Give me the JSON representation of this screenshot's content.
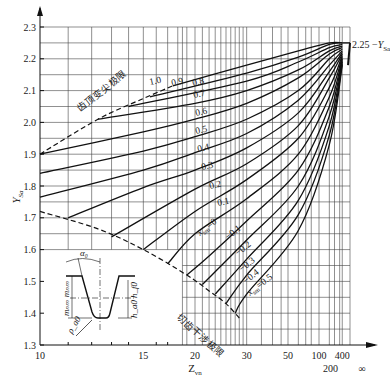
{
  "chart_data": {
    "type": "line",
    "title": "",
    "xlabel": "Z_vn",
    "ylabel": "Y_Sa",
    "xscale": "reciprocal (1 - 10/z), 10 to infinity",
    "ylim": [
      1.3,
      2.3
    ],
    "yticks": [
      1.3,
      1.4,
      1.5,
      1.6,
      1.7,
      1.8,
      1.9,
      2.0,
      2.1,
      2.2,
      2.3
    ],
    "xticks": [
      {
        "value": 10,
        "label": "10"
      },
      {
        "value": 15,
        "label": "15"
      },
      {
        "value": 20,
        "label": "20"
      },
      {
        "value": 30,
        "label": "30"
      },
      {
        "value": 50,
        "label": "50"
      },
      {
        "value": 100,
        "label": "100"
      },
      {
        "value": 200,
        "label": "200"
      },
      {
        "value": 400,
        "label": "400"
      },
      {
        "value": "inf",
        "label": "∞"
      }
    ],
    "grid": true,
    "right_annotation": "2.25 − Y_Sa",
    "limit_curves": [
      {
        "name": "齿顶变尖极限",
        "meaning": "tooth tip pointing limit",
        "style": "dashed",
        "points": [
          [
            10,
            1.9
          ],
          [
            12.3,
            2.01
          ],
          [
            15,
            2.075
          ],
          [
            17.5,
            2.115
          ]
        ]
      },
      {
        "name": "切齿干涉极限",
        "meaning": "cutting interference limit",
        "style": "dashed",
        "points": [
          [
            10,
            1.72
          ],
          [
            12.3,
            1.665
          ],
          [
            15,
            1.6
          ],
          [
            19,
            1.52
          ],
          [
            22,
            1.47
          ],
          [
            25,
            1.43
          ],
          [
            28,
            1.385
          ]
        ]
      }
    ],
    "series_label_prefix": "x_sm",
    "series": [
      {
        "name": "1.0",
        "points": [
          [
            17.5,
            2.115
          ],
          [
            30,
            2.18
          ],
          [
            60,
            2.225
          ],
          [
            150,
            2.25
          ],
          [
            400,
            2.25
          ]
        ]
      },
      {
        "name": "0.9",
        "points": [
          [
            15.5,
            2.08
          ],
          [
            30,
            2.155
          ],
          [
            60,
            2.205
          ],
          [
            150,
            2.245
          ],
          [
            400,
            2.25
          ]
        ]
      },
      {
        "name": "0.8",
        "points": [
          [
            14,
            2.05
          ],
          [
            30,
            2.13
          ],
          [
            60,
            2.19
          ],
          [
            150,
            2.235
          ],
          [
            400,
            2.245
          ]
        ]
      },
      {
        "name": "0.7",
        "points": [
          [
            12.3,
            2.01
          ],
          [
            20,
            2.06
          ],
          [
            30,
            2.1
          ],
          [
            60,
            2.165
          ],
          [
            150,
            2.225
          ],
          [
            400,
            2.24
          ]
        ]
      },
      {
        "name": "0.6",
        "points": [
          [
            10,
            1.9
          ],
          [
            15,
            1.97
          ],
          [
            20,
            2.01
          ],
          [
            30,
            2.06
          ],
          [
            60,
            2.14
          ],
          [
            150,
            2.215
          ],
          [
            400,
            2.235
          ]
        ]
      },
      {
        "name": "0.5",
        "points": [
          [
            10,
            1.84
          ],
          [
            15,
            1.91
          ],
          [
            20,
            1.955
          ],
          [
            30,
            2.01
          ],
          [
            60,
            2.1
          ],
          [
            150,
            2.2
          ],
          [
            400,
            2.23
          ]
        ]
      },
      {
        "name": "0.4",
        "points": [
          [
            10,
            1.765
          ],
          [
            15,
            1.85
          ],
          [
            20,
            1.905
          ],
          [
            30,
            1.965
          ],
          [
            60,
            2.07
          ],
          [
            150,
            2.18
          ],
          [
            400,
            2.225
          ]
        ]
      },
      {
        "name": "0.3",
        "points": [
          [
            11,
            1.7
          ],
          [
            15,
            1.795
          ],
          [
            20,
            1.85
          ],
          [
            30,
            1.92
          ],
          [
            60,
            2.03
          ],
          [
            150,
            2.16
          ],
          [
            400,
            2.22
          ]
        ]
      },
      {
        "name": "0.2",
        "points": [
          [
            13,
            1.64
          ],
          [
            20,
            1.79
          ],
          [
            30,
            1.87
          ],
          [
            60,
            1.99
          ],
          [
            150,
            2.14
          ],
          [
            400,
            2.215
          ]
        ]
      },
      {
        "name": "0.1",
        "points": [
          [
            15,
            1.6
          ],
          [
            20,
            1.72
          ],
          [
            30,
            1.82
          ],
          [
            60,
            1.95
          ],
          [
            150,
            2.11
          ],
          [
            400,
            2.21
          ]
        ]
      },
      {
        "name": "0",
        "points": [
          [
            17,
            1.555
          ],
          [
            20,
            1.65
          ],
          [
            30,
            1.76
          ],
          [
            60,
            1.9
          ],
          [
            150,
            2.08
          ],
          [
            400,
            2.205
          ]
        ]
      },
      {
        "name": "-0.1",
        "points": [
          [
            19,
            1.52
          ],
          [
            22,
            1.58
          ],
          [
            30,
            1.69
          ],
          [
            60,
            1.85
          ],
          [
            150,
            2.05
          ],
          [
            400,
            2.2
          ]
        ]
      },
      {
        "name": "-0.2",
        "points": [
          [
            21,
            1.49
          ],
          [
            30,
            1.63
          ],
          [
            60,
            1.8
          ],
          [
            150,
            2.02
          ],
          [
            400,
            2.195
          ]
        ]
      },
      {
        "name": "-0.3",
        "points": [
          [
            23,
            1.46
          ],
          [
            30,
            1.57
          ],
          [
            60,
            1.755
          ],
          [
            150,
            1.99
          ],
          [
            400,
            2.19
          ]
        ]
      },
      {
        "name": "-0.4",
        "points": [
          [
            25,
            1.43
          ],
          [
            30,
            1.52
          ],
          [
            60,
            1.71
          ],
          [
            150,
            1.96
          ],
          [
            400,
            2.185
          ]
        ]
      },
      {
        "name": "-0.5",
        "points": [
          [
            27,
            1.4
          ],
          [
            30,
            1.46
          ],
          [
            60,
            1.66
          ],
          [
            150,
            1.93
          ],
          [
            400,
            2.18
          ]
        ]
      }
    ],
    "curve_labels": [
      {
        "text": "1.0",
        "x": 150,
        "y": 85
      },
      {
        "text": "0.9",
        "x": 172,
        "y": 86
      },
      {
        "text": "0.8",
        "x": 193,
        "y": 86
      },
      {
        "text": "0.7",
        "x": 194,
        "y": 98
      },
      {
        "text": "0.6",
        "x": 196,
        "y": 116
      },
      {
        "text": "0.5",
        "x": 196,
        "y": 134
      },
      {
        "text": "0.4",
        "x": 198,
        "y": 152
      },
      {
        "text": "0.3",
        "x": 202,
        "y": 170
      },
      {
        "text": "0.2",
        "x": 210,
        "y": 189
      },
      {
        "text": "0.1",
        "x": 218,
        "y": 206
      },
      {
        "text": "x_sm=0",
        "x": 200,
        "y": 236
      },
      {
        "text": "−0.1",
        "x": 228,
        "y": 240
      },
      {
        "text": "−0.2",
        "x": 238,
        "y": 256
      },
      {
        "text": "−0.3",
        "x": 242,
        "y": 272
      },
      {
        "text": "−0.4",
        "x": 246,
        "y": 284
      },
      {
        "text": "x_sm=0.5",
        "x": 250,
        "y": 296
      }
    ],
    "inset": {
      "description": "basic rack tooth profile",
      "labels": [
        "α0",
        "m_nm",
        "m_nm",
        "h_f0",
        "h_a0",
        "ρ_a0"
      ]
    }
  }
}
